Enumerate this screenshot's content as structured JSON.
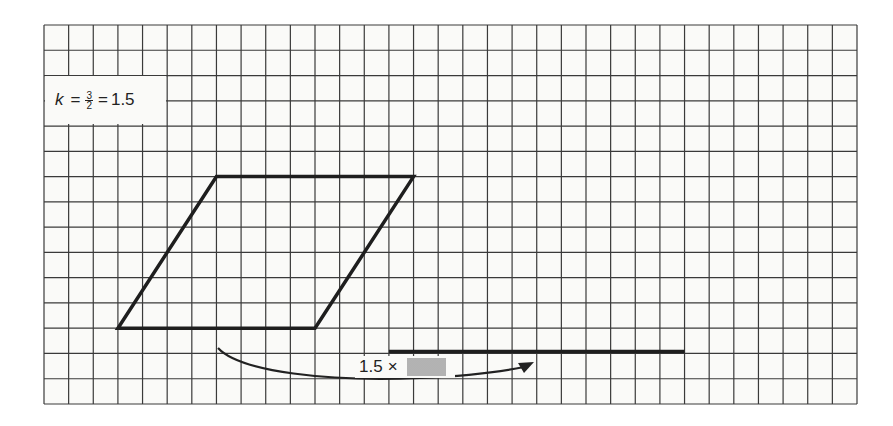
{
  "diagram": {
    "type": "enlargement-on-grid",
    "grid": {
      "left": 44,
      "top": 25,
      "right": 857,
      "bottom": 404,
      "columns": 33,
      "rows": 15,
      "line_color": "#3a3a3a",
      "background": "#fafaf8"
    },
    "scale_factor_label": {
      "variable": "k",
      "equals": "=",
      "fraction_numerator": "3",
      "fraction_denominator": "2",
      "equals2": "=",
      "value": "1.5"
    },
    "parallelogram": {
      "stroke": "#1e1e1e",
      "vertices_grid_units": [
        [
          3,
          12
        ],
        [
          11,
          12
        ],
        [
          15,
          6
        ],
        [
          7,
          6
        ]
      ],
      "base_units": 8,
      "height_units": 6
    },
    "enlarged_base_line": {
      "stroke": "#1e1e1e",
      "start_grid_units": [
        14,
        13
      ],
      "length_units": 12
    },
    "arrow": {
      "from": "parallelogram-base",
      "to": "enlarged-base-line",
      "label_prefix": "1.5",
      "label_times": "×",
      "label_placeholder": "shaded-box"
    }
  }
}
